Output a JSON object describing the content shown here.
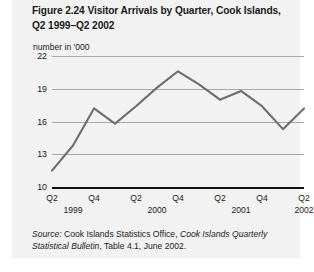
{
  "figure": {
    "title_line1": "Figure 2.24  Visitor Arrivals by Quarter, Cook Islands,",
    "title_line2": "Q2 1999–Q2 2002",
    "unit_label": "number in '000",
    "source_prefix": "Source:",
    "source_text_1": " Cook Islands Statistics Office, ",
    "source_italic": "Cook Islands Quarterly Statistical Bulletin",
    "source_text_2": ", Table 4.1, June 2002."
  },
  "colors": {
    "panel_background": "#f2f2f2",
    "page_background": "#ffffff",
    "series_line": "#6e6e6e",
    "gridline": "#a8a8a8",
    "axis": "#111111",
    "text": "#1a1a1a"
  },
  "chart_data": {
    "type": "line",
    "title": "Figure 2.24  Visitor Arrivals by Quarter, Cook Islands, Q2 1999–Q2 2002",
    "subtitle": "",
    "xlabel": "",
    "ylabel": "number in '000",
    "ylim": [
      10,
      22
    ],
    "yticks": [
      10,
      13,
      16,
      19,
      22
    ],
    "ytick_labels": [
      "10",
      "13",
      "16",
      "19",
      "22"
    ],
    "grid": true,
    "legend": false,
    "x": [
      "Q2 1999",
      "Q3 1999",
      "Q4 1999",
      "Q1 2000",
      "Q2 2000",
      "Q3 2000",
      "Q4 2000",
      "Q1 2001",
      "Q2 2001",
      "Q3 2001",
      "Q4 2001",
      "Q1 2002",
      "Q2 2002"
    ],
    "xtick_labels": [
      "Q2",
      "Q4",
      "Q2",
      "Q4",
      "Q2",
      "Q4",
      "Q2"
    ],
    "xtick_indices": [
      0,
      2,
      4,
      6,
      8,
      10,
      12
    ],
    "xyear_labels": [
      "1999",
      "2000",
      "2001",
      "2002"
    ],
    "xyear_indices": [
      1,
      5,
      9,
      12
    ],
    "series": [
      {
        "name": "Visitor arrivals",
        "values": [
          11.5,
          13.8,
          17.2,
          15.8,
          17.4,
          19.1,
          20.6,
          19.4,
          18.0,
          18.8,
          17.4,
          15.3,
          17.2
        ]
      }
    ]
  }
}
